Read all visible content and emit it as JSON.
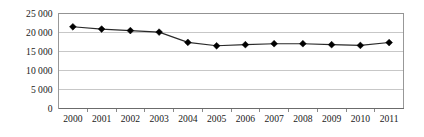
{
  "chart_data": {
    "type": "line",
    "title": "",
    "subtitle": "",
    "xlabel": "",
    "ylabel": "",
    "categories": [
      "2000",
      "2001",
      "2002",
      "2003",
      "2004",
      "2005",
      "2006",
      "2007",
      "2008",
      "2009",
      "2010",
      "2011"
    ],
    "values": [
      21500,
      20900,
      20500,
      20100,
      17400,
      16500,
      16800,
      17050,
      17050,
      16800,
      16600,
      17350
    ],
    "series": [
      {
        "name": "",
        "values": [
          21500,
          20900,
          20500,
          20100,
          17400,
          16500,
          16800,
          17050,
          17050,
          16800,
          16600,
          17350
        ]
      }
    ],
    "ylim": [
      0,
      25000
    ],
    "y_ticks": [
      0,
      5000,
      10000,
      15000,
      20000,
      25000
    ],
    "y_tick_labels": [
      "0",
      "5 000",
      "10 000",
      "15 000",
      "20 000",
      "25 000"
    ],
    "x_tick_labels": [
      "2000",
      "2001",
      "2002",
      "2003",
      "2004",
      "2005",
      "2006",
      "2007",
      "2008",
      "2009",
      "2010",
      "2011"
    ],
    "grid": true,
    "grid_axis": "y",
    "legend": false,
    "legend_position": "none",
    "marker": "diamond",
    "line_color": "#2a2a2a",
    "marker_color": "#000000",
    "grid_color": "#b9b9b9",
    "frame_color": "#8d8d8d",
    "background_color": "#ffffff",
    "annotations": []
  }
}
